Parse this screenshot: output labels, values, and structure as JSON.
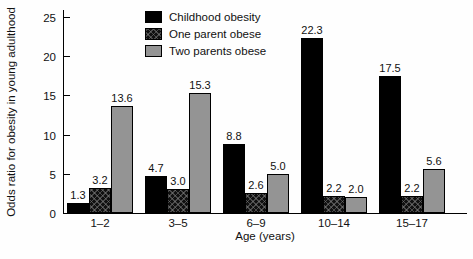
{
  "chart_data": {
    "type": "bar",
    "title": "",
    "xlabel": "Age (years)",
    "ylabel": "Odds ratio for obesity in young adulthood",
    "categories": [
      "1–2",
      "3–5",
      "6–9",
      "10–14",
      "15–17"
    ],
    "series": [
      {
        "name": "Childhood obesity",
        "color": "#000000",
        "pattern": "solid-black",
        "values": [
          1.3,
          4.7,
          8.8,
          22.3,
          17.5
        ]
      },
      {
        "name": "One parent obese",
        "color": "#101010",
        "pattern": "black-crosshatch",
        "values": [
          3.2,
          3.0,
          2.6,
          2.2,
          2.2
        ]
      },
      {
        "name": "Two parents obese",
        "color": "#949494",
        "pattern": "solid-gray",
        "values": [
          13.6,
          15.3,
          5.0,
          2.0,
          5.6
        ]
      }
    ],
    "value_labels": [
      [
        "1.3",
        "4.7",
        "8.8",
        "22.3",
        "17.5"
      ],
      [
        "3.2",
        "3.0",
        "2.6",
        "2.2",
        "2.2"
      ],
      [
        "13.6",
        "15.3",
        "5.0",
        "2.0",
        "5.6"
      ]
    ],
    "ylim": [
      0,
      25
    ],
    "yticks": [
      0,
      5,
      10,
      15,
      20,
      25
    ],
    "grid": false,
    "legend_position": "top-center",
    "tick_direction": "in"
  }
}
